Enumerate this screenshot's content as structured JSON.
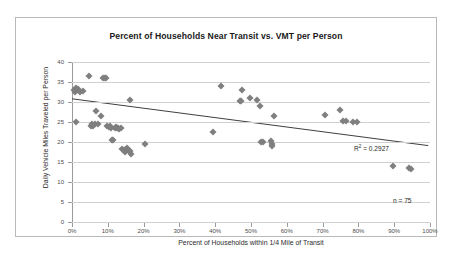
{
  "chart_data": {
    "type": "scatter",
    "title": "Percent of Households Near Transit vs. VMT per Person",
    "xlabel": "Percent of Households within 1/4 Mile of Transit",
    "ylabel": "Daily Vehicle Miles Traveled per Person",
    "xlim": [
      0,
      100
    ],
    "ylim": [
      0,
      40
    ],
    "xticks": [
      0,
      10,
      20,
      30,
      40,
      50,
      60,
      70,
      80,
      90,
      100
    ],
    "xtick_labels": [
      "0%",
      "10%",
      "20%",
      "30%",
      "40%",
      "50%",
      "60%",
      "70%",
      "80%",
      "90%",
      "100%"
    ],
    "yticks": [
      0,
      5,
      10,
      15,
      20,
      25,
      30,
      35,
      40
    ],
    "ytick_labels": [
      "0",
      "5",
      "10",
      "15",
      "20",
      "25",
      "30",
      "35",
      "40"
    ],
    "grid": "horizontal",
    "legend": "none",
    "marker": "diamond",
    "marker_color": "#7f7f7f",
    "annotations": [
      {
        "name": "r-squared",
        "text_prefix": "R",
        "text_sup": "2",
        "text_suffix": " = 0.2927",
        "value": 0.2927
      },
      {
        "name": "sample-size",
        "text": "n = 75",
        "value": 75
      }
    ],
    "trendline": {
      "type": "linear",
      "x_start": 0,
      "y_start": 30.8,
      "x_end": 99.5,
      "y_end": 19.1,
      "color": "#3f3f3f"
    },
    "points": [
      {
        "x": 0.5,
        "y": 33.0
      },
      {
        "x": 0.8,
        "y": 32.6
      },
      {
        "x": 1.0,
        "y": 33.4
      },
      {
        "x": 1.4,
        "y": 32.9
      },
      {
        "x": 1.8,
        "y": 33.3
      },
      {
        "x": 2.3,
        "y": 32.5
      },
      {
        "x": 3.2,
        "y": 32.7
      },
      {
        "x": 1.2,
        "y": 25.1
      },
      {
        "x": 4.8,
        "y": 36.6
      },
      {
        "x": 5.2,
        "y": 24.0
      },
      {
        "x": 5.5,
        "y": 24.4
      },
      {
        "x": 6.0,
        "y": 24.1
      },
      {
        "x": 6.4,
        "y": 24.5
      },
      {
        "x": 6.8,
        "y": 27.8
      },
      {
        "x": 7.4,
        "y": 24.4
      },
      {
        "x": 8.0,
        "y": 26.5
      },
      {
        "x": 8.6,
        "y": 35.9
      },
      {
        "x": 9.2,
        "y": 35.9
      },
      {
        "x": 9.6,
        "y": 36.0
      },
      {
        "x": 9.9,
        "y": 23.9
      },
      {
        "x": 10.3,
        "y": 23.7
      },
      {
        "x": 10.6,
        "y": 24.0
      },
      {
        "x": 10.9,
        "y": 23.6
      },
      {
        "x": 11.2,
        "y": 20.6
      },
      {
        "x": 11.5,
        "y": 20.4
      },
      {
        "x": 11.9,
        "y": 23.5
      },
      {
        "x": 12.3,
        "y": 23.8
      },
      {
        "x": 12.6,
        "y": 23.6
      },
      {
        "x": 12.9,
        "y": 23.4
      },
      {
        "x": 13.2,
        "y": 23.3
      },
      {
        "x": 13.6,
        "y": 23.4
      },
      {
        "x": 14.1,
        "y": 18.2
      },
      {
        "x": 14.5,
        "y": 17.9
      },
      {
        "x": 14.9,
        "y": 17.6
      },
      {
        "x": 15.3,
        "y": 18.4
      },
      {
        "x": 15.7,
        "y": 18.0
      },
      {
        "x": 16.0,
        "y": 17.7
      },
      {
        "x": 16.3,
        "y": 17.8
      },
      {
        "x": 16.6,
        "y": 17.0
      },
      {
        "x": 16.1,
        "y": 30.4
      },
      {
        "x": 20.4,
        "y": 19.4
      },
      {
        "x": 39.4,
        "y": 22.5
      },
      {
        "x": 41.6,
        "y": 34.0
      },
      {
        "x": 46.8,
        "y": 30.2
      },
      {
        "x": 47.2,
        "y": 30.3
      },
      {
        "x": 47.6,
        "y": 33.0
      },
      {
        "x": 49.6,
        "y": 31.1
      },
      {
        "x": 51.8,
        "y": 30.4
      },
      {
        "x": 52.4,
        "y": 28.9
      },
      {
        "x": 52.8,
        "y": 20.0
      },
      {
        "x": 53.4,
        "y": 19.9
      },
      {
        "x": 55.6,
        "y": 20.2
      },
      {
        "x": 55.9,
        "y": 19.6
      },
      {
        "x": 56.0,
        "y": 18.9
      },
      {
        "x": 56.4,
        "y": 26.5
      },
      {
        "x": 70.8,
        "y": 26.8
      },
      {
        "x": 74.8,
        "y": 28.0
      },
      {
        "x": 75.6,
        "y": 25.3
      },
      {
        "x": 76.4,
        "y": 25.3
      },
      {
        "x": 78.6,
        "y": 25.0
      },
      {
        "x": 79.6,
        "y": 25.1
      },
      {
        "x": 89.8,
        "y": 14.1
      },
      {
        "x": 94.2,
        "y": 13.6
      },
      {
        "x": 94.6,
        "y": 13.2
      }
    ]
  }
}
